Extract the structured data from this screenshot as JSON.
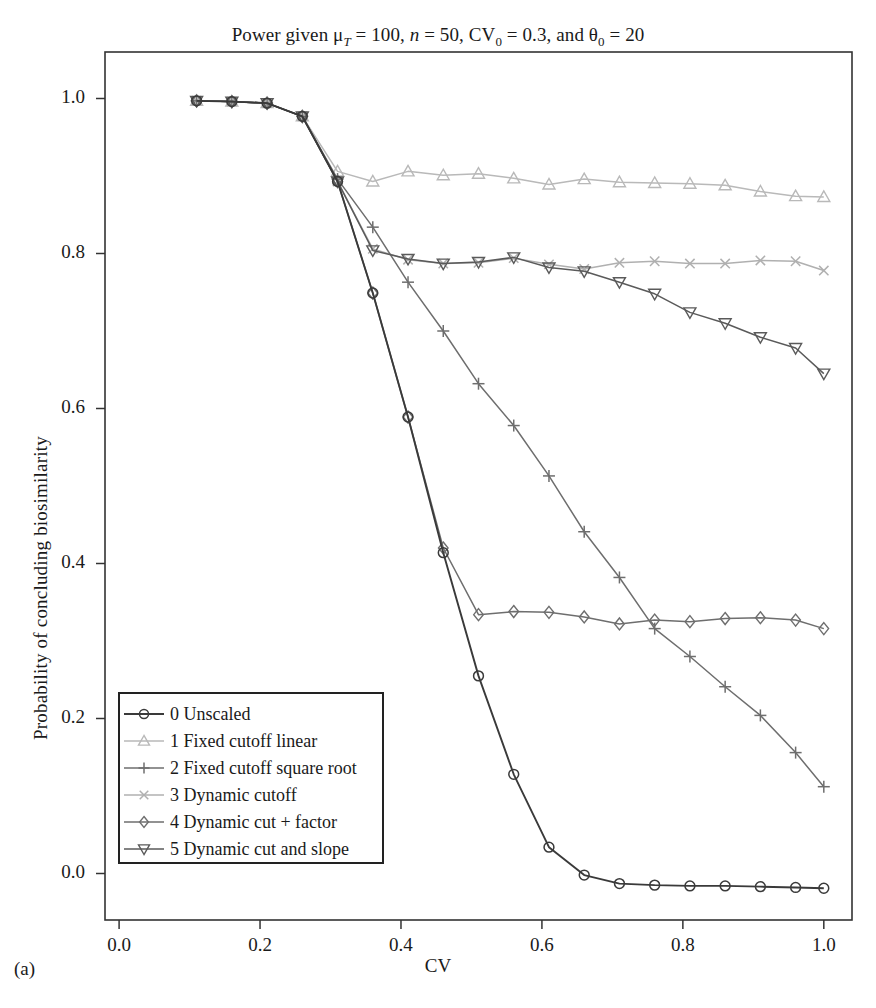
{
  "figure": {
    "panel_caption": "(a)",
    "title_plain": "Power given μT = 100, n = 50, CV0 = 0.3, and θ0 = 20",
    "title_parts": {
      "p1": "Power given ",
      "mu": "μ",
      "mu_sub": "T",
      "p2": " = 100, ",
      "n": "n",
      "p3": " = 50, CV",
      "cv_sub": "0",
      "p4": " = 0.3, and ",
      "theta": "θ",
      "theta_sub": "0",
      "p5": " = 20"
    }
  },
  "chart_data": {
    "type": "line",
    "title": "Power given μT = 100, n = 50, CV0 = 0.3, and θ0 = 20",
    "xlabel": "CV",
    "ylabel": "Probability of concluding biosimilarity",
    "xlim": [
      -0.02,
      1.04
    ],
    "ylim": [
      -0.06,
      1.06
    ],
    "xticks": [
      "0.0",
      "0.2",
      "0.4",
      "0.6",
      "0.8",
      "1.0"
    ],
    "xtick_values": [
      0.0,
      0.2,
      0.4,
      0.6,
      0.8,
      1.0
    ],
    "yticks": [
      "0.0",
      "0.2",
      "0.4",
      "0.6",
      "0.8",
      "1.0"
    ],
    "ytick_values": [
      0.0,
      0.2,
      0.4,
      0.6,
      0.8,
      1.0
    ],
    "grid": false,
    "legend_position": "lower-left",
    "x": [
      0.11,
      0.16,
      0.21,
      0.26,
      0.31,
      0.36,
      0.41,
      0.46,
      0.51,
      0.56,
      0.61,
      0.66,
      0.71,
      0.76,
      0.81,
      0.86,
      0.91,
      0.96,
      1.0
    ],
    "series": [
      {
        "name": "0 Unscaled",
        "marker": "circle",
        "color": "#3a3a3a",
        "values": [
          0.997,
          0.996,
          0.994,
          0.977,
          0.893,
          0.749,
          0.589,
          0.414,
          0.255,
          0.128,
          0.034,
          -0.002,
          -0.013,
          -0.015,
          -0.016,
          -0.016,
          -0.017,
          -0.018,
          -0.019
        ]
      },
      {
        "name": "1 Fixed cutoff linear",
        "marker": "triangle-up",
        "color": "#b9b9b9",
        "values": [
          0.997,
          0.996,
          0.994,
          0.977,
          0.906,
          0.893,
          0.906,
          0.901,
          0.903,
          0.897,
          0.889,
          0.896,
          0.892,
          0.891,
          0.89,
          0.888,
          0.88,
          0.874,
          0.873
        ]
      },
      {
        "name": "2 Fixed cutoff square root",
        "marker": "plus",
        "color": "#6e6e6e",
        "values": [
          0.997,
          0.996,
          0.994,
          0.977,
          0.896,
          0.834,
          0.763,
          0.7,
          0.632,
          0.578,
          0.513,
          0.441,
          0.382,
          0.316,
          0.28,
          0.241,
          0.204,
          0.156,
          0.112
        ]
      },
      {
        "name": "3 Dynamic cutoff",
        "marker": "x",
        "color": "#b0b0b0",
        "values": [
          0.997,
          0.996,
          0.994,
          0.977,
          0.893,
          0.806,
          0.792,
          0.787,
          0.788,
          0.794,
          0.786,
          0.78,
          0.788,
          0.79,
          0.787,
          0.787,
          0.791,
          0.79,
          0.778
        ]
      },
      {
        "name": "4 Dynamic cut + factor",
        "marker": "diamond",
        "color": "#6e6e6e",
        "values": [
          0.997,
          0.996,
          0.994,
          0.977,
          0.893,
          0.749,
          0.589,
          0.42,
          0.334,
          0.338,
          0.337,
          0.331,
          0.322,
          0.327,
          0.325,
          0.329,
          0.33,
          0.327,
          0.316
        ]
      },
      {
        "name": "5 Dynamic cut and slope",
        "marker": "triangle-down",
        "color": "#5a5a5a",
        "values": [
          0.997,
          0.996,
          0.994,
          0.977,
          0.893,
          0.804,
          0.793,
          0.787,
          0.789,
          0.795,
          0.782,
          0.777,
          0.763,
          0.748,
          0.724,
          0.71,
          0.692,
          0.678,
          0.645
        ]
      }
    ]
  },
  "legend": {
    "items": [
      {
        "label": "0 Unscaled",
        "marker": "circle",
        "color": "#3a3a3a"
      },
      {
        "label": "1 Fixed cutoff linear",
        "marker": "triangle-up",
        "color": "#b9b9b9"
      },
      {
        "label": "2 Fixed cutoff square root",
        "marker": "plus",
        "color": "#6e6e6e"
      },
      {
        "label": "3 Dynamic cutoff",
        "marker": "x",
        "color": "#b0b0b0"
      },
      {
        "label": "4 Dynamic cut + factor",
        "marker": "diamond",
        "color": "#6e6e6e"
      },
      {
        "label": "5 Dynamic cut and slope",
        "marker": "triangle-down",
        "color": "#5a5a5a"
      }
    ]
  }
}
